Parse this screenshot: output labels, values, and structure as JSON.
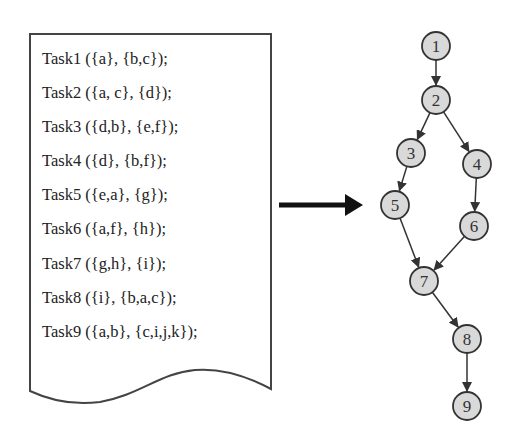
{
  "document": {
    "tasks": [
      "Task1 ({a}, {b,c});",
      "Task2 ({a, c}, {d});",
      "Task3 ({d,b}, {e,f});",
      "Task4 ({d}, {b,f});",
      "Task5 ({e,a}, {g});",
      "Task6 ({a,f}, {h});",
      "Task7 ({g,h}, {i});",
      "Task8 ({i}, {b,a,c});",
      "Task9 ({a,b}, {c,i,j,k});"
    ]
  },
  "graph": {
    "nodes": [
      {
        "id": "1",
        "x": 436,
        "y": 46
      },
      {
        "id": "2",
        "x": 436,
        "y": 100
      },
      {
        "id": "3",
        "x": 411,
        "y": 153
      },
      {
        "id": "4",
        "x": 477,
        "y": 164
      },
      {
        "id": "5",
        "x": 395,
        "y": 205
      },
      {
        "id": "6",
        "x": 474,
        "y": 226
      },
      {
        "id": "7",
        "x": 424,
        "y": 281
      },
      {
        "id": "8",
        "x": 467,
        "y": 339
      },
      {
        "id": "9",
        "x": 467,
        "y": 406
      }
    ],
    "edges": [
      [
        "1",
        "2"
      ],
      [
        "2",
        "3"
      ],
      [
        "2",
        "4"
      ],
      [
        "3",
        "5"
      ],
      [
        "4",
        "6"
      ],
      [
        "5",
        "7"
      ],
      [
        "6",
        "7"
      ],
      [
        "7",
        "8"
      ],
      [
        "8",
        "9"
      ]
    ],
    "colors": {
      "node_fill": "#d9d9d9",
      "stroke": "#333333"
    }
  }
}
